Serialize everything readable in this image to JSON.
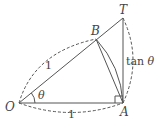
{
  "diagram": {
    "points": {
      "O": {
        "label": "O",
        "x": 19,
        "y": 103
      },
      "A": {
        "label": "A",
        "x": 123,
        "y": 103
      },
      "T": {
        "label": "T",
        "x": 123,
        "y": 18
      },
      "B": {
        "label": "B",
        "x": 96,
        "y": 39
      }
    },
    "labels": {
      "angle": "θ",
      "radius_upper": "1",
      "radius_lower": "1",
      "tan_prefix": "tan ",
      "tan_theta": "θ"
    },
    "colors": {
      "stroke": "#555555",
      "text": "#444444"
    }
  }
}
